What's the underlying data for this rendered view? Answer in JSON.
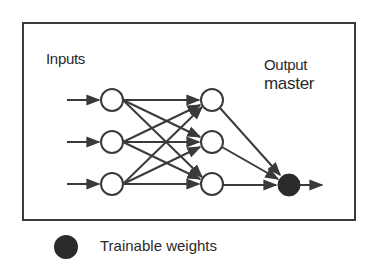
{
  "diagram": {
    "inputs_label": "Inputs",
    "output_label_line1": "Output",
    "output_label_line2": "master",
    "layers": {
      "input_nodes": 3,
      "hidden_nodes": 3,
      "output_nodes": 1
    },
    "output_node_style": "filled",
    "colors": {
      "stroke": "#3a3a3a",
      "node_fill": "#ffffff",
      "trainable_fill": "#2b2b2b"
    }
  },
  "legend": {
    "items": [
      {
        "symbol": "filled-circle",
        "label": "Trainable weights"
      }
    ]
  }
}
